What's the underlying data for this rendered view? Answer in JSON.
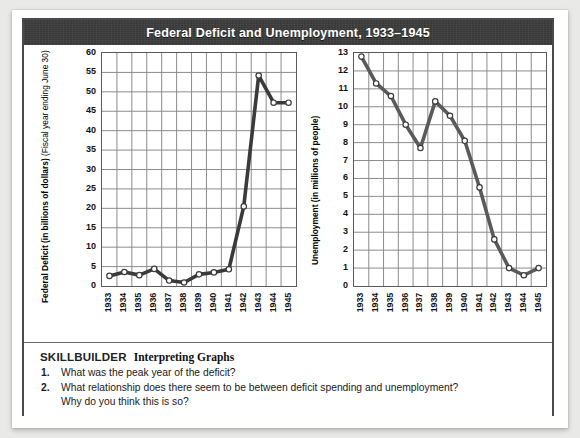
{
  "banner": {
    "title": "Federal Deficit and Unemployment, 1933–1945"
  },
  "skillbuilder": {
    "title": "SKILLBUILDER",
    "subtitle": "Interpreting Graphs",
    "questions": [
      {
        "num": "1.",
        "line1": "What was the peak year of the deficit?",
        "line2": ""
      },
      {
        "num": "2.",
        "line1": "What relationship does there seem to be between deficit spending and unemployment?",
        "line2": "Why do you think this is so?"
      }
    ]
  },
  "chart_data": [
    {
      "type": "line",
      "id": "federal-deficit",
      "title": "",
      "xlabel": "",
      "ylabel": "Federal Deficit (in billions of dollars)",
      "ylabel_sub": "(Fiscal year ending June 30)",
      "categories": [
        "1933",
        "1934",
        "1935",
        "1936",
        "1937",
        "1938",
        "1939",
        "1940",
        "1941",
        "1942",
        "1943",
        "1944",
        "1945"
      ],
      "values": [
        2.6,
        3.6,
        2.8,
        4.4,
        1.4,
        0.9,
        3.0,
        3.5,
        4.3,
        20.5,
        54.2,
        47.2,
        47.2
      ],
      "ylim": [
        0,
        60
      ],
      "yticks": [
        0,
        5,
        10,
        15,
        20,
        25,
        30,
        35,
        40,
        45,
        50,
        55,
        60
      ],
      "grid": true,
      "legend": "none",
      "line_color": "#3a3a3a",
      "marker_fill": "#ffffff",
      "marker_edge": "#3a3a3a"
    },
    {
      "type": "line",
      "id": "unemployment",
      "title": "",
      "xlabel": "",
      "ylabel": "Unemployment (in millions of people)",
      "ylabel_sub": "",
      "categories": [
        "1933",
        "1934",
        "1935",
        "1936",
        "1937",
        "1938",
        "1939",
        "1940",
        "1941",
        "1942",
        "1943",
        "1944",
        "1945"
      ],
      "values": [
        12.8,
        11.3,
        10.6,
        9.0,
        7.7,
        10.3,
        9.5,
        8.1,
        5.5,
        2.6,
        1.0,
        0.6,
        1.0
      ],
      "ylim": [
        0,
        13
      ],
      "yticks": [
        0,
        1,
        2,
        3,
        4,
        5,
        6,
        7,
        8,
        9,
        10,
        11,
        12,
        13
      ],
      "grid": true,
      "legend": "none",
      "line_color": "#5a5a5a",
      "marker_fill": "#ffffff",
      "marker_edge": "#3a3a3a"
    }
  ]
}
